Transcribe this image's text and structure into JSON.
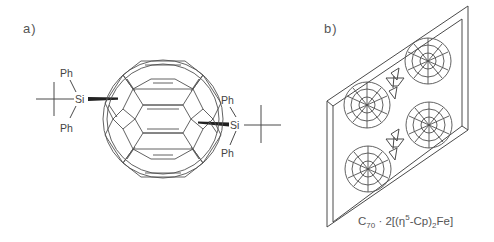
{
  "figure": {
    "panels": [
      {
        "label": "a)",
        "description": "C70 fullerene bis-silylated with tert-butyldiphenylsilyl groups",
        "cage": "C70",
        "substituents": [
          {
            "position": "left",
            "atom": "Si",
            "groups": [
              "Ph",
              "Ph",
              "tBu"
            ],
            "bond": "wedge"
          },
          {
            "position": "right",
            "atom": "Si",
            "groups": [
              "Ph",
              "Ph",
              "tBu"
            ],
            "bond": "wedge"
          }
        ]
      },
      {
        "label": "b)",
        "description": "Crystal packing layer of C70 with ferrocene",
        "fullerene_count": 4,
        "ferrocene_count": 2,
        "caption": {
          "prefix": "C",
          "sub1": "70",
          "middle": " · 2[(η",
          "sup": "5",
          "after_sup": "-Cp)",
          "sub2": "2",
          "suffix": "Fe]"
        }
      }
    ],
    "atom_labels": {
      "silicon": "Si",
      "phenyl": "Ph"
    }
  }
}
